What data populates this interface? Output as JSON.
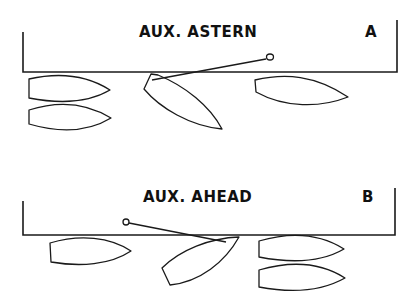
{
  "diagram": {
    "panels": [
      {
        "id": "A",
        "title": "AUX. ASTERN",
        "label": "A",
        "boats": 4,
        "description": "Boat leaving berth going astern with spring line to ring on quay"
      },
      {
        "id": "B",
        "title": "AUX. AHEAD",
        "label": "B",
        "boats": 5,
        "description": "Boat leaving berth going ahead with spring line to ring on quay"
      }
    ],
    "colors": {
      "ink": "#1a1a1a",
      "background": "#ffffff"
    }
  }
}
